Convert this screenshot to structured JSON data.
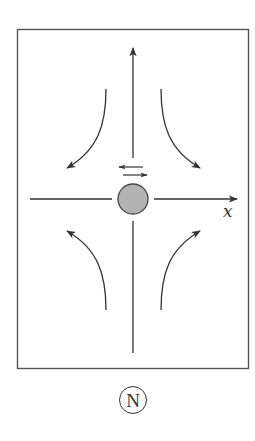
{
  "diagram": {
    "axis_label": "x",
    "panel_label": "N",
    "colors": {
      "stroke": "#333333",
      "particle_fill": "#b3b3b3",
      "particle_stroke": "#444444",
      "frame": "#555555"
    },
    "elements": {
      "frame": "rectangular border",
      "particle": "gray circle at center",
      "vertical_axis": "upward arrow above particle, plain line below",
      "horizontal_axis": "line left of particle, arrow pointing right labeled x",
      "oscillation_arrows": [
        "left-pointing arrow",
        "right-pointing arrow"
      ],
      "flow_arrows": [
        "upper-left curve pointing down-left",
        "upper-right curve pointing down-right",
        "lower-left curve pointing up-left",
        "lower-right curve pointing up-right"
      ]
    }
  }
}
